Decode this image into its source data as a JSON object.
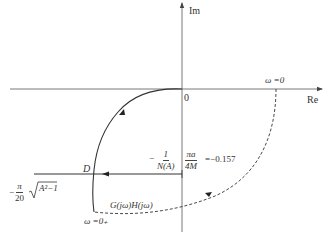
{
  "diagram": {
    "type": "nyquist-plot-with-describing-function",
    "axes": {
      "real_label": "Re",
      "imag_label": "Im",
      "origin_label": "0"
    },
    "labels": {
      "omega_zero_right": "ω =0",
      "omega_zero_bottom": "ω =0₊",
      "point_d": "D",
      "curve_name": "G(jω)H(jω)",
      "neg_inv_na_num": "1",
      "neg_inv_na_den": "N(A)",
      "neg_sign": "−",
      "pi_a_num": "πa",
      "pi_a_den": "4M",
      "equals_value": "=−0.157",
      "left_expr_sign": "−",
      "left_expr_num": "π",
      "left_expr_den": "20",
      "left_expr_sqrt": "A²−1"
    },
    "colors": {
      "line": "#333333",
      "background": "#ffffff"
    }
  }
}
